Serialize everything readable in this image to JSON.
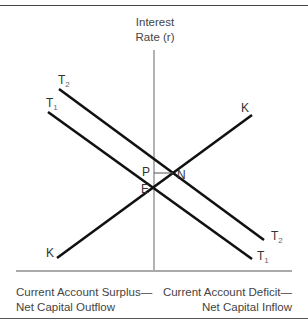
{
  "diagram": {
    "y_axis_label_line1": "Interest",
    "y_axis_label_line2": "Rate  (r)",
    "curves": {
      "T2": {
        "letter": "T",
        "sub": "2"
      },
      "T1": {
        "letter": "T",
        "sub": "1"
      },
      "K": {
        "label": "K"
      }
    },
    "points": {
      "P": "P",
      "N": "N",
      "E": "E"
    },
    "footer_left_line1": "Current Account Surplus—",
    "footer_left_line2": "Net Capital Outflow",
    "footer_right_line1": "Current Account Deficit—",
    "footer_right_line2": "Net Capital Inflow"
  }
}
